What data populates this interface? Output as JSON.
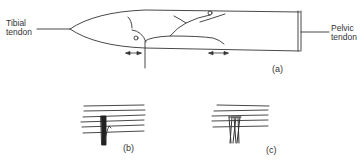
{
  "figure": {
    "panels": [
      {
        "id": "a",
        "label": "(a)",
        "description": "Muscle outline with nerve branches between tibial and pelvic tendons",
        "annotations": {
          "left_tendon": [
            "Tibial",
            "tendon"
          ],
          "right_tendon": [
            "Pelvic",
            "tendon"
          ]
        },
        "arrows": 2
      },
      {
        "id": "b",
        "label": "(b)",
        "description": "Horizontal fibers crossed by a single dark vertical bundle",
        "horizontal_lines": 6
      },
      {
        "id": "c",
        "label": "(c)",
        "description": "Horizontal fibers crossed by a braided multi-strand bundle",
        "horizontal_lines": 5
      }
    ],
    "colors": {
      "ink": "#333333",
      "background": "#ffffff"
    }
  }
}
